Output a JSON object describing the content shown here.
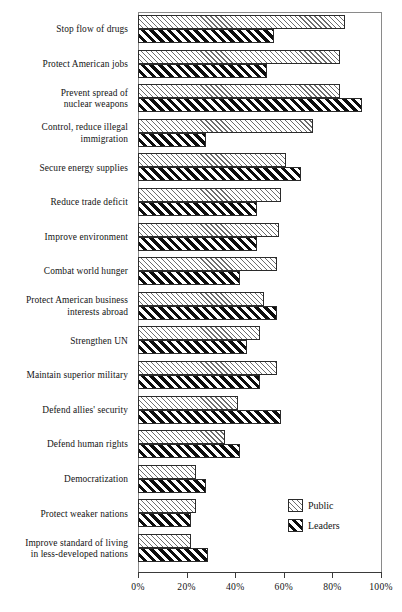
{
  "chart_data": {
    "type": "bar",
    "orientation": "horizontal",
    "title": "",
    "subtitle": "",
    "xlabel": "",
    "ylabel": "",
    "xlim": [
      0,
      100
    ],
    "xtick_labels": [
      "0%",
      "20%",
      "40%",
      "60%",
      "80%",
      "100%"
    ],
    "xtick_values": [
      0,
      20,
      40,
      60,
      80,
      100
    ],
    "grid": false,
    "legend_position": "inside-bottom-right",
    "categories": [
      "Stop flow  of drugs",
      "Protect American jobs",
      "Prevent spread of\nnuclear weapons",
      "Control, reduce illegal\nimmigration",
      "Secure energy supplies",
      "Reduce trade deficit",
      "Improve environment",
      "Combat world hunger",
      "Protect American business\ninterests abroad",
      "Strengthen UN",
      "Maintain superior military",
      "Defend allies' security",
      "Defend human rights",
      "Democratization",
      "Protect weaker nations",
      "Improve standard of living\nin less-developed nations"
    ],
    "series": [
      {
        "name": "Public",
        "hatch": "thin-forward",
        "values": [
          85,
          83,
          83,
          72,
          61,
          59,
          58,
          57,
          52,
          50,
          57,
          41,
          36,
          24,
          24,
          22
        ]
      },
      {
        "name": "Leaders",
        "hatch": "thick-forward",
        "values": [
          56,
          53,
          92,
          28,
          67,
          49,
          49,
          42,
          57,
          45,
          50,
          59,
          42,
          28,
          22,
          29
        ]
      }
    ]
  },
  "legend": {
    "items": [
      {
        "label": "Public",
        "key": "public"
      },
      {
        "label": "Leaders",
        "key": "leaders"
      }
    ]
  },
  "colors": {
    "axis": "#3a3a3a",
    "frame": "#8a8a8a",
    "text": "#141414",
    "public_hatch": "#6d6d6d",
    "leaders_hatch": "#0d0d0d",
    "background": "#ffffff"
  }
}
